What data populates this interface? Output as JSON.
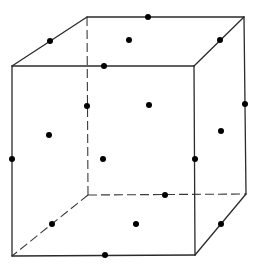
{
  "diagram": {
    "colors": {
      "background": "#ffffff",
      "edge": "#2b2b2b",
      "point": "#000000"
    },
    "vertices": {
      "front_top_left": [
        12,
        66
      ],
      "front_top_right": [
        194,
        66
      ],
      "front_bottom_left": [
        12,
        256
      ],
      "front_bottom_right": [
        195,
        255
      ],
      "back_top_left": [
        87,
        17
      ],
      "back_top_right": [
        244,
        17
      ],
      "back_bottom_left": [
        88,
        195
      ],
      "back_bottom_right": [
        246,
        194
      ]
    },
    "solid_edges": [
      [
        "front_top_left",
        "front_top_right"
      ],
      [
        "front_top_right",
        "front_bottom_right"
      ],
      [
        "front_bottom_right",
        "front_bottom_left"
      ],
      [
        "front_bottom_left",
        "front_top_left"
      ],
      [
        "front_top_left",
        "back_top_left"
      ],
      [
        "back_top_left",
        "back_top_right"
      ],
      [
        "back_top_right",
        "front_top_right"
      ],
      [
        "back_top_right",
        "back_bottom_right"
      ],
      [
        "back_bottom_right",
        "front_bottom_right"
      ]
    ],
    "hidden_edges": [
      [
        "back_top_left",
        "back_bottom_left"
      ],
      [
        "back_bottom_left",
        "back_bottom_right"
      ],
      [
        "back_bottom_left",
        "front_bottom_left"
      ]
    ],
    "edge_midpoints": [
      {
        "label": "top-front",
        "pos": [
          104,
          66
        ]
      },
      {
        "label": "top-back",
        "pos": [
          148,
          17
        ]
      },
      {
        "label": "top-left",
        "pos": [
          50,
          41
        ]
      },
      {
        "label": "top-right",
        "pos": [
          220,
          40
        ]
      },
      {
        "label": "bottom-front",
        "pos": [
          105,
          255
        ]
      },
      {
        "label": "bottom-back",
        "pos": [
          165,
          195
        ]
      },
      {
        "label": "bottom-left",
        "pos": [
          52,
          224
        ]
      },
      {
        "label": "bottom-right",
        "pos": [
          221,
          224
        ]
      },
      {
        "label": "vertical-front-left",
        "pos": [
          12,
          159
        ]
      },
      {
        "label": "vertical-front-right",
        "pos": [
          195,
          159
        ]
      },
      {
        "label": "vertical-back-left",
        "pos": [
          87,
          106
        ]
      },
      {
        "label": "vertical-back-right",
        "pos": [
          245,
          104
        ]
      }
    ],
    "face_centers": [
      {
        "label": "top",
        "pos": [
          129,
          40
        ]
      },
      {
        "label": "bottom",
        "pos": [
          136,
          224
        ]
      },
      {
        "label": "front",
        "pos": [
          103,
          159
        ]
      },
      {
        "label": "back",
        "pos": [
          149,
          105
        ]
      },
      {
        "label": "left",
        "pos": [
          49,
          135
        ]
      },
      {
        "label": "right",
        "pos": [
          221,
          131
        ]
      }
    ],
    "point_radius": 3
  }
}
